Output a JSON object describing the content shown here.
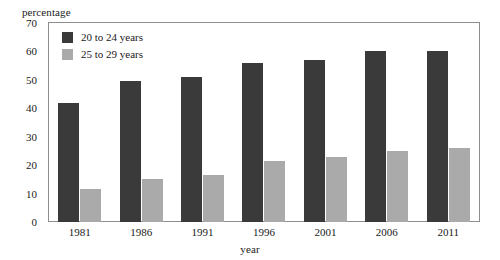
{
  "chart_data": {
    "type": "bar",
    "title": "",
    "subtitle": "",
    "xlabel": "year",
    "ylabel": "percentage",
    "categories": [
      "1981",
      "1986",
      "1991",
      "1996",
      "2001",
      "2006",
      "2011"
    ],
    "series": [
      {
        "name": "20 to 24 years",
        "color": "#3a3a3a",
        "values": [
          42,
          49.5,
          51,
          56,
          57,
          60,
          60
        ]
      },
      {
        "name": "25 to 29 years",
        "color": "#aaaaaa",
        "values": [
          11.5,
          15,
          16.5,
          21.5,
          23,
          25,
          26
        ]
      }
    ],
    "ylim": [
      0,
      70
    ],
    "ytick_labels": [
      "70",
      "60",
      "50",
      "40",
      "30",
      "20",
      "10",
      "0"
    ],
    "ytick_values": [
      70,
      60,
      50,
      40,
      30,
      20,
      10,
      0
    ],
    "grid": false,
    "legend_position": "top-left",
    "frame": true,
    "frame_color": "#8d8d8d",
    "background": "#ffffff"
  },
  "axes": {
    "y_title": "percentage",
    "x_title": "year"
  },
  "legend": {
    "entries": [
      {
        "label": "20 to 24 years",
        "swatch": "dark"
      },
      {
        "label": "25 to 29 years",
        "swatch": "light"
      }
    ]
  }
}
